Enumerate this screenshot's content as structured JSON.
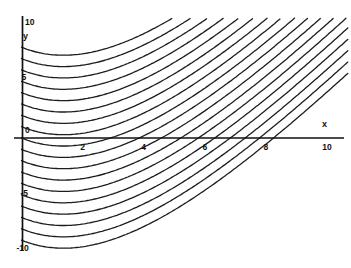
{
  "figure": {
    "background": "#ffffff",
    "ink": "#1d1d1d",
    "axis_color": "#101010"
  },
  "chart_data": {
    "type": "line",
    "title": "",
    "xlabel": "x",
    "ylabel": "y",
    "origin_label": "0",
    "x_ticks": [
      2,
      4,
      6,
      8,
      10
    ],
    "y_ticks": [
      10,
      5,
      0,
      -5,
      -10
    ],
    "x_range": [
      0,
      10.8
    ],
    "y_range": [
      -10,
      10
    ],
    "grid": false,
    "legend": false,
    "family": {
      "kind": "vertical-translates",
      "curve_model": "y(x) = y0 + S*x - (A/b)*(1 - exp(-b*x))",
      "S": 2.7,
      "A": 3.8,
      "b": 0.25,
      "y_intercepts": [
        8,
        7,
        6,
        5,
        4,
        3,
        2,
        1,
        0,
        -1,
        -2,
        -3,
        -4,
        -5,
        -6,
        -7,
        -8,
        -9
      ],
      "notes": "curves start on the y-axis, dip to a shallow minimum near x=1.4, then rise toward the upper right as nearly parallel diagonals; lower-right region is empty"
    }
  }
}
